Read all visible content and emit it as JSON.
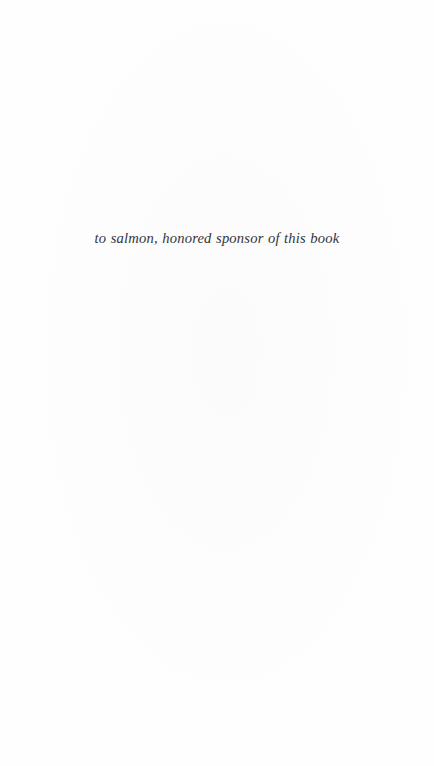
{
  "page": {
    "kind": "book-dedication-page",
    "background_color": "#ffffff",
    "paper_tone_color": "#fefefe"
  },
  "dedication": {
    "text": "to salmon, honored sponsor of this book",
    "text_color": "#24242a",
    "style": "italic-serif",
    "alignment": "center"
  }
}
